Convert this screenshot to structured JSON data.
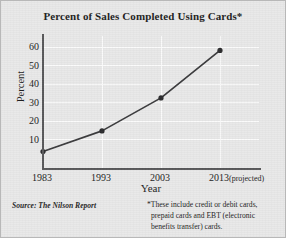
{
  "chart_data": {
    "type": "line",
    "title": "Percent of Sales Completed Using Cards*",
    "xlabel": "Year",
    "ylabel": "Percent",
    "categories": [
      "1983",
      "1993",
      "2003",
      "2013"
    ],
    "x_tick_labels": [
      "1983",
      "1993",
      "2003",
      "2013"
    ],
    "x_tick_suffixes": [
      "",
      "",
      "",
      "(projected)"
    ],
    "values": [
      8,
      18,
      34,
      57
    ],
    "ylim": [
      0,
      64
    ],
    "y_ticks": [
      10,
      20,
      30,
      40,
      50,
      60
    ],
    "y_tick_labels": [
      "10",
      "20",
      "30",
      "40",
      "50",
      "60"
    ],
    "grid": "both",
    "legend": "none",
    "series": [
      {
        "name": "Percent of sales completed using cards",
        "values": [
          8,
          18,
          34,
          57
        ]
      }
    ],
    "marker": "filled-circle",
    "line_color": "#3a3a3c",
    "marker_color": "#2b2b2d",
    "gridline_color": "#fbfbfb",
    "axis_color": "#58585a",
    "background_color": "#e9e9e9"
  },
  "source_note": "Source: The Nilson Report",
  "footnote": {
    "lines": [
      "*These include credit or debit cards,",
      "prepaid cards and EBT (electronic",
      "benefits transfer) cards."
    ]
  }
}
